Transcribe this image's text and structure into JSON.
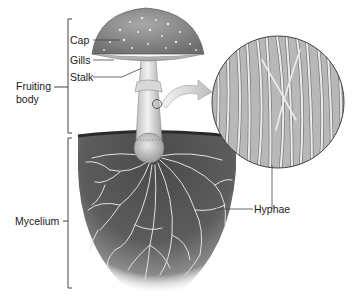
{
  "diagram": {
    "labels": {
      "cap": "Cap",
      "gills": "Gills",
      "stalk": "Stalk",
      "fruiting_body_line1": "Fruiting",
      "fruiting_body_line2": "body",
      "mycelium": "Mycelium",
      "hyphae": "Hyphae"
    },
    "colors": {
      "ink": "#1a1a1a",
      "bracket": "#444444",
      "soil_dark": "#3a3a3a",
      "soil_mid": "#6a6a6a",
      "hyphae_light": "#e6e6e6",
      "cap_gray": "#8c8c8c",
      "stalk_light": "#dcdcdc",
      "magnifier_bg": "#bdbdbd"
    }
  }
}
